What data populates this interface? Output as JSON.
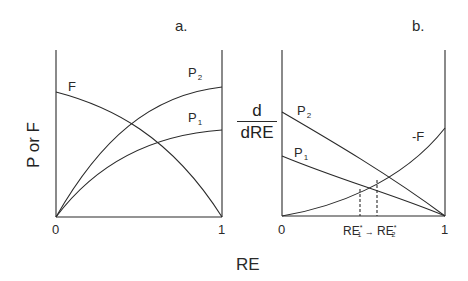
{
  "figure": {
    "panel_a": {
      "letter": "a.",
      "y_axis_title": "P or F",
      "x_ticks": [
        "0",
        "1"
      ],
      "curves": [
        {
          "name": "F",
          "label": "F",
          "subscript": ""
        },
        {
          "name": "P2",
          "label": "P",
          "subscript": "2"
        },
        {
          "name": "P1",
          "label": "P",
          "subscript": "1"
        }
      ]
    },
    "panel_b": {
      "letter": "b.",
      "y_axis_title_num": "d",
      "y_axis_title_den": "dRE",
      "x_ticks": [
        "0",
        "1"
      ],
      "marker_1": {
        "base": "RE",
        "sup": "*",
        "sub": "1"
      },
      "arrow": "→",
      "marker_2": {
        "base": "RE",
        "sup": "*",
        "sub": "2"
      },
      "curves": [
        {
          "name": "P2",
          "label": "P",
          "subscript": "2"
        },
        {
          "name": "P1",
          "label": "P",
          "subscript": "1"
        },
        {
          "name": "-F",
          "label": "-F",
          "subscript": ""
        }
      ]
    },
    "x_axis_title": "RE"
  },
  "colors": {
    "line": "#2a2a2a",
    "background": "#ffffff"
  }
}
